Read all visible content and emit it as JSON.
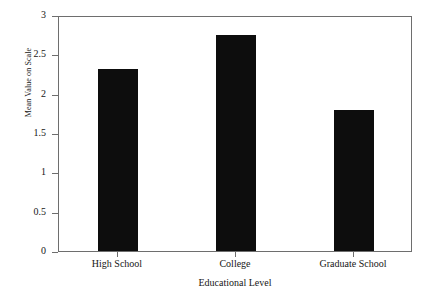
{
  "chart_data": {
    "type": "bar",
    "title": "",
    "subtitle": "",
    "xlabel": "Educational Level",
    "ylabel": "Mean Value on Scale",
    "categories": [
      "High School",
      "College",
      "Graduate School"
    ],
    "values": [
      2.31,
      2.75,
      1.79
    ],
    "ylim": [
      0,
      3
    ],
    "xlim_note": "categorical",
    "yticks": [
      "0",
      "0.5",
      "1",
      "1.5",
      "2",
      "2.5",
      "3"
    ],
    "ytick_values": [
      0,
      0.5,
      1,
      1.5,
      2,
      2.5,
      3
    ],
    "grid": false,
    "legend": null,
    "legend_position": "none",
    "bar_color": "#0d0d0d",
    "axis_color": "#6e6e6e",
    "background": "#ffffff",
    "annotations": []
  },
  "axes": {
    "y_title": "Mean Value on Scale",
    "x_title": "Educational Level"
  }
}
